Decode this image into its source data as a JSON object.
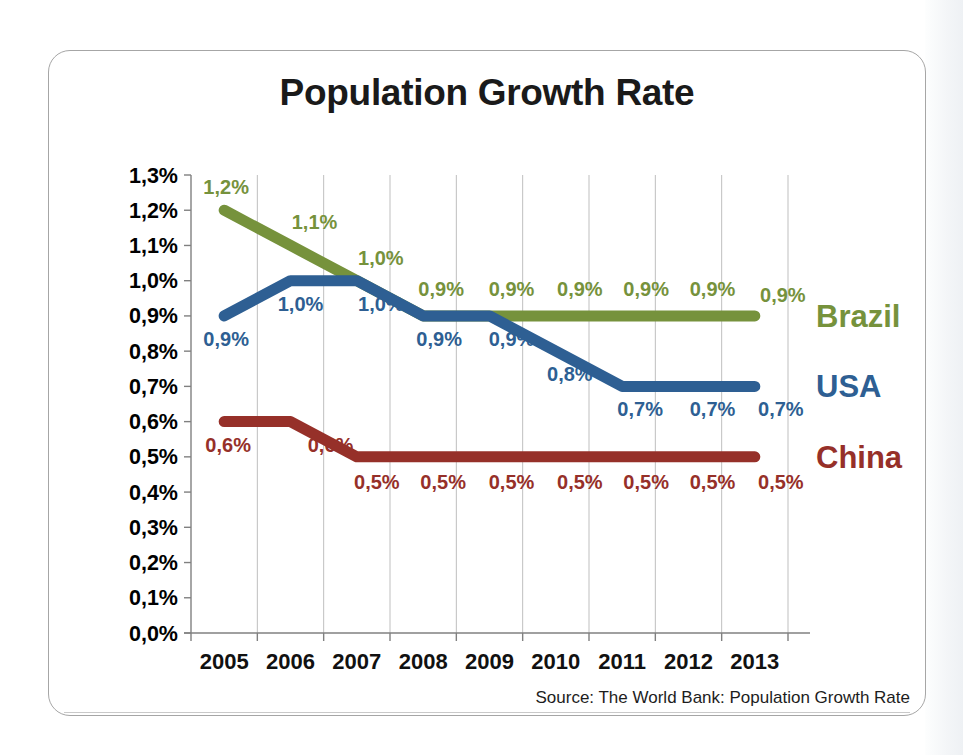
{
  "slide": {
    "title": "Population Growth Rate",
    "source_note": "Source: The World Bank: Population Growth Rate"
  },
  "colors": {
    "brazil": "#76923c",
    "usa": "#2e5f93",
    "china": "#963029",
    "axis": "#808080",
    "gridline": "#bfbfbf",
    "title": "#1a1a1a",
    "frame": "#a6a6a6"
  },
  "chart_data": {
    "type": "line",
    "title": "Population Growth Rate",
    "xlabel": "",
    "ylabel": "",
    "categories": [
      "2005",
      "2006",
      "2007",
      "2008",
      "2009",
      "2010",
      "2011",
      "2012",
      "2013"
    ],
    "ylim": [
      0.0,
      1.3
    ],
    "ytick_values": [
      1.3,
      1.2,
      1.1,
      1.0,
      0.9,
      0.8,
      0.7,
      0.6,
      0.5,
      0.4,
      0.3,
      0.2,
      0.1,
      0.0
    ],
    "ytick_labels": [
      "1,3%",
      "1,2%",
      "1,1%",
      "1,0%",
      "0,9%",
      "0,8%",
      "0,7%",
      "0,6%",
      "0,5%",
      "0,4%",
      "0,3%",
      "0,2%",
      "0,1%",
      "0,0%"
    ],
    "grid": "vertical-only",
    "legend_position": "right-inline",
    "series": [
      {
        "name": "Brazil",
        "color": "#76923c",
        "values": [
          1.2,
          1.1,
          1.0,
          0.9,
          0.9,
          0.9,
          0.9,
          0.9,
          0.9
        ],
        "labels": [
          "1,2%",
          "1,1%",
          "1,0%",
          "0,9%",
          "0,9%",
          "0,9%",
          "0,9%",
          "0,9%",
          "0,9%"
        ]
      },
      {
        "name": "USA",
        "color": "#2e5f93",
        "values": [
          0.9,
          1.0,
          1.0,
          0.9,
          0.9,
          0.8,
          0.7,
          0.7,
          0.7
        ],
        "labels": [
          "0,9%",
          "1,0%",
          "1,0%",
          "0,9%",
          "0,9%",
          "0,8%",
          "0,7%",
          "0,7%",
          "0,7%"
        ]
      },
      {
        "name": "China",
        "color": "#963029",
        "values": [
          0.6,
          0.6,
          0.5,
          0.5,
          0.5,
          0.5,
          0.5,
          0.5,
          0.5
        ],
        "labels": [
          "0,6%",
          "0,6%",
          "0,5%",
          "0,5%",
          "0,5%",
          "0,5%",
          "0,5%",
          "0,5%",
          "0,5%"
        ]
      }
    ]
  }
}
